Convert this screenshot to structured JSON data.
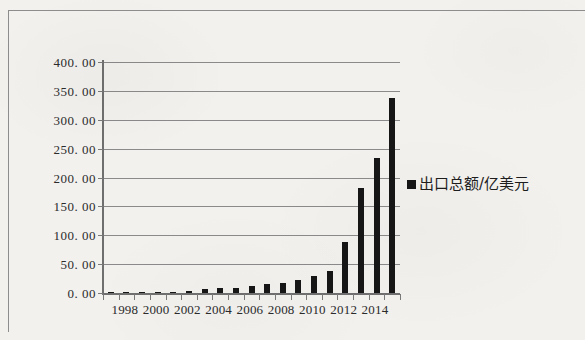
{
  "chart_data": {
    "type": "bar",
    "title": "",
    "subtitle": "",
    "xlabel": "",
    "ylabel": "",
    "ylim": [
      0,
      400
    ],
    "ytick_step": 50,
    "ytick_labels": [
      "400. 00",
      "350. 00",
      "300. 00",
      "250. 00",
      "200. 00",
      "150. 00",
      "100. 00",
      "50. 00",
      "0. 00"
    ],
    "ytick_values": [
      400,
      350,
      300,
      250,
      200,
      150,
      100,
      50,
      0
    ],
    "grid": true,
    "grid_axis": "y",
    "legend_position": "right",
    "legend": [
      "出口总额/亿美元"
    ],
    "categories": [
      "1997",
      "1998",
      "1999",
      "2000",
      "2001",
      "2002",
      "2003",
      "2004",
      "2005",
      "2006",
      "2007",
      "2008",
      "2009",
      "2010",
      "2011",
      "2012",
      "2013",
      "2014",
      "2015"
    ],
    "xtick_labels_shown": [
      "1998",
      "2000",
      "2002",
      "2004",
      "2006",
      "2008",
      "2010",
      "2012",
      "2014"
    ],
    "series": [
      {
        "name": "出口总额/亿美元",
        "color": "#161616",
        "values": [
          0.3,
          0.5,
          0.8,
          1.2,
          2.0,
          3.0,
          7.0,
          8.0,
          9.0,
          12.0,
          15.0,
          18.0,
          22.0,
          29.0,
          38.0,
          88.0,
          181.0,
          234.0,
          338.0
        ]
      }
    ]
  },
  "legend": {
    "marker": "black-square",
    "label": "出口总额/亿美元"
  },
  "colors": {
    "bar": "#161616",
    "gridline": "#8a8a8a",
    "axis": "#6f6f6f",
    "text": "#2b2b2b",
    "background": "#f2f1ee"
  }
}
